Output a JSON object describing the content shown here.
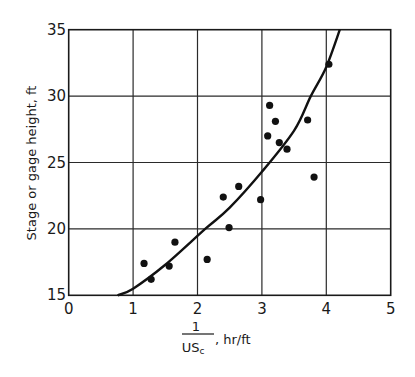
{
  "chart_data": {
    "type": "scatter",
    "title": "",
    "xlabel": "1/US_c, hr/ft",
    "xlabel_parts": {
      "numerator": "1",
      "denominator": "US",
      "subscript": "c",
      "unit": ", hr/ft"
    },
    "ylabel": "Stage or gage height, ft",
    "xlim": [
      0,
      5
    ],
    "ylim": [
      15,
      35
    ],
    "x_ticks": [
      "0",
      "1",
      "2",
      "3",
      "4",
      "5"
    ],
    "y_ticks": [
      "15",
      "20",
      "25",
      "30",
      "35"
    ],
    "grid": true,
    "legend": null,
    "series": [
      {
        "name": "observations",
        "kind": "scatter",
        "points": [
          [
            1.17,
            17.4
          ],
          [
            1.28,
            16.2
          ],
          [
            1.56,
            17.2
          ],
          [
            1.65,
            19.0
          ],
          [
            2.15,
            17.7
          ],
          [
            2.4,
            22.4
          ],
          [
            2.49,
            20.1
          ],
          [
            2.64,
            23.2
          ],
          [
            2.98,
            22.2
          ],
          [
            3.09,
            27.0
          ],
          [
            3.12,
            29.3
          ],
          [
            3.21,
            28.1
          ],
          [
            3.27,
            26.5
          ],
          [
            3.39,
            26.0
          ],
          [
            3.71,
            28.2
          ],
          [
            3.81,
            23.9
          ],
          [
            4.04,
            32.4
          ]
        ]
      },
      {
        "name": "fitted curve",
        "kind": "line",
        "points": [
          [
            0.76,
            15.0
          ],
          [
            1.0,
            15.5
          ],
          [
            1.5,
            17.3
          ],
          [
            2.12,
            20.0
          ],
          [
            2.5,
            21.6
          ],
          [
            3.0,
            24.3
          ],
          [
            3.5,
            27.4
          ],
          [
            3.76,
            30.0
          ],
          [
            4.0,
            32.2
          ],
          [
            4.21,
            35.0
          ]
        ]
      }
    ]
  }
}
